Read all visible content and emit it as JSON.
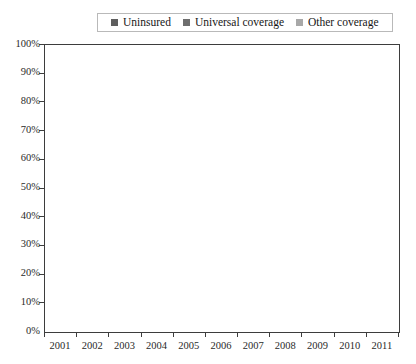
{
  "legend": {
    "position": "top-center",
    "entries": [
      {
        "label": "Uninsured",
        "color": "#5e5e5e"
      },
      {
        "label": "Universal coverage",
        "color": "#6e6e6e"
      },
      {
        "label": "Other coverage",
        "color": "#a8a8a8"
      }
    ]
  },
  "axes": {
    "y_ticks": [
      "0%",
      "10%",
      "20%",
      "30%",
      "40%",
      "50%",
      "60%",
      "70%",
      "80%",
      "90%",
      "100%"
    ],
    "x_ticks": [
      "2001",
      "2002",
      "2003",
      "2004",
      "2005",
      "2006",
      "2007",
      "2008",
      "2009",
      "2010",
      "2011"
    ]
  },
  "chart_data": {
    "type": "bar",
    "stacked": true,
    "title": "",
    "subtitle": "",
    "xlabel": "",
    "ylabel": "",
    "ylim": [
      0,
      100
    ],
    "ytick_step": 10,
    "grid": false,
    "legend_position": "top-center",
    "categories": [
      "2001",
      "2002",
      "2003",
      "2004",
      "2005",
      "2006",
      "2007",
      "2008",
      "2009",
      "2010",
      "2011"
    ],
    "series": [
      {
        "name": "Uninsured",
        "color": "#5e5e5e",
        "values": [
          29,
          13,
          5,
          5,
          5,
          6,
          5,
          null,
          0,
          null,
          0
        ]
      },
      {
        "name": "Universal coverage",
        "color": "#6e6e6e",
        "values": [
          0,
          74.5,
          75,
          75,
          72.5,
          72,
          72,
          null,
          77,
          null,
          77
        ]
      },
      {
        "name": "Other coverage",
        "color": "#a8a8a8",
        "values": [
          71,
          12.5,
          20,
          20,
          22.5,
          22,
          23,
          null,
          23,
          null,
          23
        ]
      }
    ],
    "missing_categories": [
      "2008",
      "2010"
    ]
  }
}
